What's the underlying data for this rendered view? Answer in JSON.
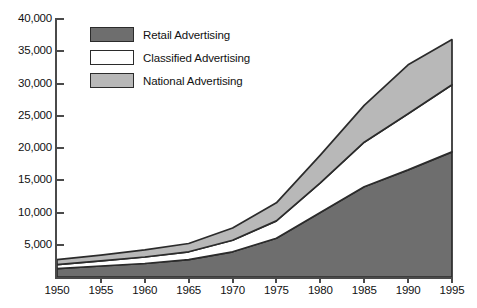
{
  "chart_data": {
    "type": "area",
    "stacked": true,
    "title": "",
    "subtitle": "",
    "xlabel": "",
    "ylabel": "",
    "x": [
      1950,
      1955,
      1960,
      1965,
      1970,
      1975,
      1980,
      1985,
      1990,
      1995
    ],
    "categories": [
      "1950",
      "1955",
      "1960",
      "1965",
      "1970",
      "1975",
      "1980",
      "1985",
      "1990",
      "1995"
    ],
    "xtick_labels": [
      "1950",
      "1955",
      "1960",
      "1965",
      "1970",
      "1975",
      "1980",
      "1985",
      "1990",
      "1995"
    ],
    "ytick_labels": [
      "5,000",
      "10,000",
      "15,000",
      "20,000",
      "25,000",
      "30,000",
      "35,000",
      "40,000"
    ],
    "ytick_values": [
      5000,
      10000,
      15000,
      20000,
      25000,
      30000,
      35000,
      40000
    ],
    "xlim": [
      1950,
      1995
    ],
    "ylim": [
      0,
      40000
    ],
    "grid": false,
    "legend_position": "top-left-inside",
    "series": [
      {
        "name": "Retail Advertising",
        "color": "#6e6e6e",
        "values": [
          1300,
          1700,
          2100,
          2700,
          3900,
          6000,
          10000,
          14000,
          16600,
          19400
        ]
      },
      {
        "name": "Classified Advertising",
        "color": "#ffffff",
        "values": [
          600,
          800,
          1000,
          1200,
          1800,
          2700,
          4600,
          6900,
          8700,
          10400
        ]
      },
      {
        "name": "National Advertising",
        "color": "#b8b8b8",
        "values": [
          800,
          900,
          1100,
          1300,
          1900,
          2800,
          4300,
          5700,
          7600,
          7000
        ]
      }
    ],
    "stack_tops": {
      "retail": [
        1300,
        1700,
        2100,
        2700,
        3900,
        6000,
        10000,
        14000,
        16600,
        19400
      ],
      "retail_plus_class": [
        1900,
        2500,
        3100,
        3900,
        5700,
        8700,
        14600,
        20900,
        25300,
        29800
      ],
      "total": [
        2700,
        3400,
        4200,
        5200,
        7600,
        11500,
        18900,
        26600,
        32900,
        36800
      ]
    }
  },
  "legend": {
    "items": [
      {
        "label": "Retail Advertising",
        "swatch": "#6e6e6e"
      },
      {
        "label": "Classified Advertising",
        "swatch": "#ffffff"
      },
      {
        "label": "National Advertising",
        "swatch": "#b8b8b8"
      }
    ]
  },
  "colors": {
    "retail": "#6e6e6e",
    "classified": "#ffffff",
    "national": "#b8b8b8",
    "outline": "#2b2b2b",
    "axis": "#4a4a4a",
    "background": "#ffffff"
  }
}
